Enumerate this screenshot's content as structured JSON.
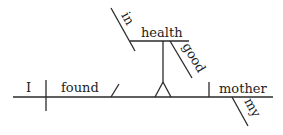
{
  "diagram": {
    "type": "sentence-diagram",
    "subject": "I",
    "verb": "found",
    "object": "mother",
    "object_modifier": "my",
    "object_complement": {
      "phrase_object": "health",
      "preposition": "in",
      "phrase_object_modifier": "good"
    }
  }
}
